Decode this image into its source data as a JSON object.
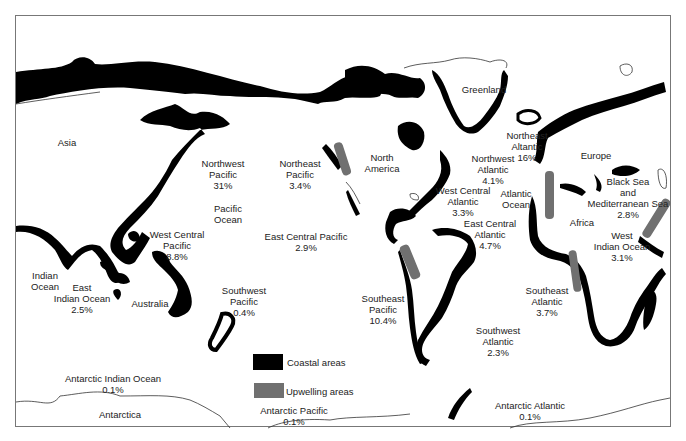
{
  "colors": {
    "coastal": "#000000",
    "upwelling": "#707070",
    "outline": "#333333",
    "background": "#ffffff"
  },
  "legend": {
    "coastal_label": "Coastal areas",
    "upwelling_label": "Upwelling areas"
  },
  "landmasses": {
    "asia": "Asia",
    "north_america": "North America",
    "greenland": "Greenland",
    "europe": "Europe",
    "africa": "Africa",
    "australia": "Australia",
    "antarctica": "Antarctica"
  },
  "oceans": {
    "pacific": "Pacific Ocean",
    "atlantic": "Atlantic Ocean",
    "indian": "Indian Ocean"
  },
  "regions": [
    {
      "id": "northwest-pacific",
      "line1": "Northwest",
      "line2": "Pacific",
      "share": "31%"
    },
    {
      "id": "northeast-pacific",
      "line1": "Northeast",
      "line2": "Pacific",
      "share": "3.4%"
    },
    {
      "id": "west-central-pacific",
      "line1": "West Central",
      "line2": "Pacific",
      "share": "8.8%"
    },
    {
      "id": "east-central-pacific",
      "line1": "East Central Pacific",
      "line2": "",
      "share": "2.9%"
    },
    {
      "id": "southwest-pacific",
      "line1": "Southwest",
      "line2": "Pacific",
      "share": "0.4%"
    },
    {
      "id": "southeast-pacific",
      "line1": "Southeast",
      "line2": "Pacific",
      "share": "10.4%"
    },
    {
      "id": "northwest-atlantic",
      "line1": "Northwest",
      "line2": "Atlantic",
      "share": "4.1%"
    },
    {
      "id": "northeast-atlantic",
      "line1": "Northeast",
      "line2": "Altantic",
      "share": "16%"
    },
    {
      "id": "west-central-atlantic",
      "line1": "West Central",
      "line2": "Atlantic",
      "share": "3.3%"
    },
    {
      "id": "east-central-atlantic",
      "line1": "East Central",
      "line2": "Atlantic",
      "share": "4.7%"
    },
    {
      "id": "southwest-atlantic",
      "line1": "Southwest",
      "line2": "Atlantic",
      "share": "2.3%"
    },
    {
      "id": "southeast-atlantic",
      "line1": "Southeast",
      "line2": "Atlantic",
      "share": "3.7%"
    },
    {
      "id": "black-sea-mediterranean",
      "line1": "Black Sea",
      "line2": "and",
      "line3": "Mediterranean Sea",
      "share": "2.8%"
    },
    {
      "id": "west-indian-ocean",
      "line1": "West",
      "line2": "Indian Ocean",
      "share": "3.1%"
    },
    {
      "id": "east-indian-ocean",
      "line1": "East",
      "line2": "Indian Ocean",
      "share": "2.5%"
    },
    {
      "id": "antarctic-indian-ocean",
      "line1": "Antarctic Indian Ocean",
      "line2": "",
      "share": "0.1%"
    },
    {
      "id": "antarctic-pacific",
      "line1": "Antarctic Pacific",
      "line2": "",
      "share": "0.1%"
    },
    {
      "id": "antarctic-atlantic",
      "line1": "Antarctic Atlantic",
      "line2": "",
      "share": "0.1%"
    }
  ]
}
